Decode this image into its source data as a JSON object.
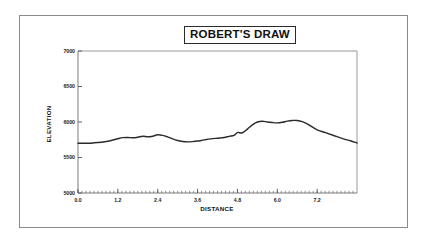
{
  "figure": {
    "background_color": "#ffffff",
    "border_color": "#8a8a8a",
    "title": "ROBERT'S DRAW"
  },
  "chart_data": {
    "type": "line",
    "title": "ROBERT'S DRAW",
    "xlabel": "DISTANCE",
    "ylabel": "ELEVATION",
    "xlim": [
      0.0,
      8.4
    ],
    "ylim": [
      5000,
      7000
    ],
    "grid": false,
    "legend": null,
    "line_color": "#2b2b2b",
    "xticks": [
      0.0,
      1.2,
      2.4,
      3.6,
      4.8,
      6.0,
      7.2
    ],
    "xtick_labels": [
      "0.0",
      "1.2",
      "2.4",
      "3.6",
      "4.8",
      "6.0",
      "7.2"
    ],
    "xtick_minor_step": 0.12,
    "yticks": [
      5000,
      5500,
      6000,
      6500,
      7000
    ],
    "ytick_labels": [
      "5000",
      "5500",
      "6000",
      "6500",
      "7000"
    ],
    "series": [
      {
        "name": "elevation profile",
        "x": [
          0.0,
          0.2,
          0.4,
          0.6,
          0.8,
          1.0,
          1.2,
          1.35,
          1.5,
          1.65,
          1.8,
          1.95,
          2.1,
          2.25,
          2.4,
          2.55,
          2.7,
          2.85,
          3.0,
          3.15,
          3.3,
          3.45,
          3.6,
          3.8,
          4.0,
          4.2,
          4.4,
          4.55,
          4.7,
          4.8,
          4.95,
          5.1,
          5.25,
          5.4,
          5.55,
          5.7,
          5.85,
          6.0,
          6.15,
          6.3,
          6.45,
          6.6,
          6.75,
          6.9,
          7.05,
          7.2,
          7.45,
          7.7,
          7.95,
          8.2,
          8.4
        ],
        "y": [
          5700,
          5700,
          5702,
          5710,
          5722,
          5740,
          5765,
          5780,
          5782,
          5778,
          5786,
          5800,
          5792,
          5800,
          5820,
          5812,
          5790,
          5762,
          5740,
          5726,
          5720,
          5724,
          5732,
          5748,
          5762,
          5772,
          5782,
          5798,
          5812,
          5850,
          5848,
          5900,
          5960,
          6000,
          6012,
          6000,
          5992,
          5988,
          5996,
          6012,
          6022,
          6020,
          6005,
          5975,
          5930,
          5890,
          5850,
          5810,
          5770,
          5735,
          5705
        ]
      }
    ]
  },
  "axes": {
    "x_axis_label": "DISTANCE",
    "y_axis_label": "ELEVATION"
  }
}
